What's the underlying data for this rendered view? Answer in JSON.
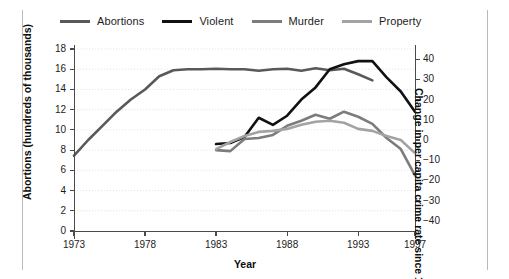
{
  "chart_data": {
    "type": "line",
    "title": "",
    "subtitle": "",
    "xlabel": "Year",
    "ylabel": "Abortions (hundreds of thousands)",
    "ylabel_right": "Change in per capita crime rate since 1983 (percent)",
    "xlim": [
      1973,
      1997
    ],
    "xticks": [
      1973,
      1978,
      1983,
      1988,
      1993,
      1997
    ],
    "xticklabels": [
      "1973",
      "1978",
      "1983",
      "1988",
      "1993",
      "1997"
    ],
    "ylim": [
      0,
      18
    ],
    "yticks": [
      0,
      2,
      4,
      6,
      8,
      10,
      12,
      14,
      16,
      18
    ],
    "yticklabels": [
      "0",
      "2",
      "4",
      "6",
      "8",
      "10",
      "12",
      "14",
      "16",
      "18"
    ],
    "ylim_right": [
      -45,
      45
    ],
    "yticks_right": [
      -40,
      -30,
      -20,
      -10,
      0,
      10,
      20,
      30,
      40
    ],
    "yticklabels_right": [
      "−40",
      "−30",
      "−20",
      "−10",
      "0",
      "10",
      "20",
      "30",
      "40"
    ],
    "grid": true,
    "legend_position": "top",
    "series": [
      {
        "name": "Abortions",
        "axis": "left",
        "color": "#595959",
        "width": 2.6,
        "x": [
          1973,
          1974,
          1975,
          1976,
          1977,
          1978,
          1979,
          1980,
          1981,
          1982,
          1983,
          1984,
          1985,
          1986,
          1987,
          1988,
          1989,
          1990,
          1991,
          1992,
          1993,
          1994
        ],
        "y": [
          7.45,
          9.0,
          10.4,
          11.8,
          13.0,
          14.0,
          15.3,
          15.9,
          16.0,
          16.0,
          16.05,
          16.0,
          16.0,
          15.85,
          16.0,
          16.05,
          15.85,
          16.1,
          15.9,
          16.05,
          15.5,
          14.9
        ]
      },
      {
        "name": "Violent",
        "axis": "right",
        "color": "#111111",
        "width": 2.6,
        "x": [
          1983,
          1984,
          1985,
          1986,
          1987,
          1988,
          1989,
          1990,
          1991,
          1992,
          1993,
          1994,
          1995,
          1996,
          1997
        ],
        "y": [
          -2.0,
          -1.5,
          1.5,
          11.0,
          7.5,
          12.0,
          20.0,
          26.0,
          35.0,
          37.5,
          39.0,
          39.0,
          31.0,
          24.0,
          14.0
        ]
      },
      {
        "name": "Murder",
        "axis": "right",
        "color": "#7c7c7c",
        "width": 2.6,
        "x": [
          1983,
          1984,
          1985,
          1986,
          1987,
          1988,
          1989,
          1990,
          1991,
          1992,
          1993,
          1994,
          1995,
          1996,
          1997
        ],
        "y": [
          -5.0,
          -5.5,
          0.5,
          1.0,
          2.5,
          7.0,
          9.5,
          12.5,
          10.5,
          14.0,
          11.5,
          8.0,
          1.0,
          -4.5,
          -17.5
        ]
      },
      {
        "name": "Property",
        "axis": "right",
        "color": "#a3a3a3",
        "width": 2.6,
        "x": [
          1983,
          1984,
          1985,
          1986,
          1987,
          1988,
          1989,
          1990,
          1991,
          1992,
          1993,
          1994,
          1995,
          1996,
          1997
        ],
        "y": [
          -4.5,
          -1.0,
          2.0,
          4.0,
          4.5,
          5.5,
          7.5,
          9.0,
          9.5,
          8.5,
          5.5,
          4.5,
          2.0,
          0.0,
          -6.5
        ]
      }
    ]
  },
  "legend": {
    "items": [
      {
        "label": "Abortions",
        "color": "#595959"
      },
      {
        "label": "Violent",
        "color": "#111111"
      },
      {
        "label": "Murder",
        "color": "#7c7c7c"
      },
      {
        "label": "Property",
        "color": "#a3a3a3"
      }
    ]
  },
  "axes": {
    "left_title": "Abortions (hundreds of thousands)",
    "right_title": "Change in per capita crime rate since 1983 (percent)",
    "x_title": "Year"
  }
}
